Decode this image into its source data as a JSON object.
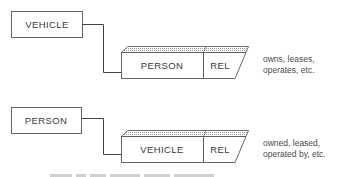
{
  "diagram": {
    "colors": {
      "stroke": "#555555",
      "text": "#3a3a3a",
      "hatch": "#9a9a9a",
      "background": "#ffffff"
    },
    "groups": [
      {
        "entity": "VEHICLE",
        "record": {
          "key": "PERSON",
          "rel": "REL"
        },
        "note_lines": [
          "owns, leases,",
          "operates, etc."
        ]
      },
      {
        "entity": "PERSON",
        "record": {
          "key": "VEHICLE",
          "rel": "REL"
        },
        "note_lines": [
          "owned, leased,",
          "operated by, etc."
        ]
      }
    ]
  }
}
